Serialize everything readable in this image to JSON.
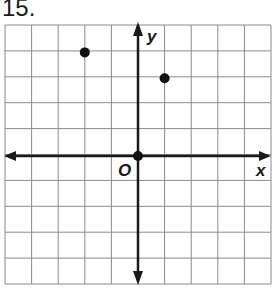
{
  "problem": {
    "number": "15."
  },
  "graph": {
    "x_label": "x",
    "y_label": "y",
    "origin_label": "O",
    "x_range": [
      -5,
      5
    ],
    "y_range": [
      -5,
      5
    ],
    "grid": true,
    "points": [
      {
        "x": -2,
        "y": 4
      },
      {
        "x": 1,
        "y": 3
      },
      {
        "x": 0,
        "y": 0
      }
    ],
    "colors": {
      "grid": "#8a8a8a",
      "axis": "#1a1a1a",
      "point": "#111111"
    }
  },
  "chart_data": {
    "type": "scatter",
    "title": "15.",
    "xlabel": "x",
    "ylabel": "y",
    "xlim": [
      -5,
      5
    ],
    "ylim": [
      -5,
      5
    ],
    "grid": true,
    "series": [
      {
        "name": "points",
        "x": [
          -2,
          1,
          0
        ],
        "y": [
          4,
          3,
          0
        ]
      }
    ]
  }
}
